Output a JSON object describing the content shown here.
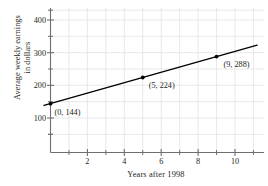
{
  "chart_data": {
    "type": "scatter",
    "title": "",
    "subtitle": "",
    "xlabel": "Years after 1998",
    "ylabel": "Average weekly earnings\nin dollars",
    "ylabel_line1": "Average weekly earnings",
    "ylabel_line2": "in dollars",
    "xlim": [
      -1,
      11.3
    ],
    "ylim": [
      0,
      440
    ],
    "grid": true,
    "grid_color": "#e3e3e6",
    "legend": "none",
    "series": [
      {
        "name": "Average weekly earnings",
        "marker": "dot",
        "color": "#000000",
        "points": [
          {
            "x": 0,
            "y": 144,
            "label": "(0, 144)"
          },
          {
            "x": 5,
            "y": 224,
            "label": "(5, 224)"
          },
          {
            "x": 9,
            "y": 288,
            "label": "(9, 288)"
          }
        ]
      }
    ],
    "trendline": {
      "color": "#000000",
      "intercept": 144,
      "slope": 16,
      "x_start": -0.35,
      "x_end": 11.2
    },
    "x_major_ticks": [
      2,
      4,
      6,
      8,
      10
    ],
    "x_major_tick_labels": [
      "2",
      "4",
      "6",
      "8",
      "10"
    ],
    "x_minor_ticks": [
      1,
      3,
      5,
      7,
      9,
      11
    ],
    "y_major_ticks": [
      100,
      200,
      300,
      400
    ],
    "y_major_tick_labels": [
      "100",
      "200",
      "300",
      "400"
    ],
    "y_minor_ticks": [
      50,
      150,
      250,
      350,
      430
    ]
  }
}
